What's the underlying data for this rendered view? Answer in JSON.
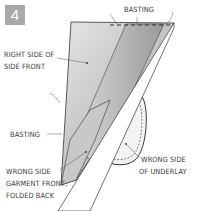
{
  "figure": {
    "step_number": "4",
    "labels": {
      "basting_top": "BASTING",
      "right_side_line1": "RIGHT SIDE OF",
      "right_side_line2": "SIDE FRONT",
      "basting_left": "BASTING",
      "wrong_side_front_line1": "WRONG SIDE",
      "wrong_side_front_line2": "GARMENT FRONT,",
      "wrong_side_front_line3": "FOLDED BACK",
      "underlay_line1": "WRONG SIDE",
      "underlay_line2": "OF UNDERLAY"
    },
    "colors": {
      "badge": "#a9a9a9",
      "fabric_shade": "#bdbdbd",
      "line": "#333333"
    }
  }
}
